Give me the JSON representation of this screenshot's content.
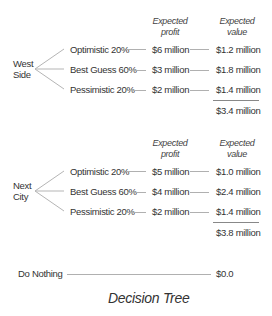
{
  "diagram": {
    "title": "Decision Tree",
    "headers": {
      "profit": [
        "Expected",
        "profit"
      ],
      "value": [
        "Expected",
        "value"
      ]
    },
    "options": [
      {
        "name": [
          "West",
          "Side"
        ],
        "branches": [
          {
            "scenario": "Optimistic 20%",
            "profit": "$6 million",
            "value": "$1.2 million"
          },
          {
            "scenario": "Best Guess 60%",
            "profit": "$3 million",
            "value": "$1.8 million"
          },
          {
            "scenario": "Pessimistic 20%",
            "profit": "$2 million",
            "value": "$1.4 million"
          }
        ],
        "total": "$3.4 million"
      },
      {
        "name": [
          "Next",
          "City"
        ],
        "branches": [
          {
            "scenario": "Optimistic 20%",
            "profit": "$5 million",
            "value": "$1.0 million"
          },
          {
            "scenario": "Best Guess 60%",
            "profit": "$4 million",
            "value": "$2.4 million"
          },
          {
            "scenario": "Pessimistic 20%",
            "profit": "$2 million",
            "value": "$1.4 million"
          }
        ],
        "total": "$3.8 million"
      },
      {
        "name": [
          "Do Nothing"
        ],
        "value": "$0.0"
      }
    ],
    "colors": {
      "text": "#333333",
      "line": "#b0b0b0"
    }
  }
}
